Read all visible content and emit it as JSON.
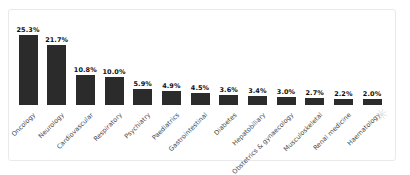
{
  "page": {
    "background": "#ffffff"
  },
  "panel": {
    "border_color": "#e9e9e9",
    "background": "#ffffff"
  },
  "chart_data": {
    "type": "bar",
    "title": "",
    "xlabel": "",
    "ylabel": "",
    "categories": [
      "Oncology",
      "Neurology",
      "Cardiovascular",
      "Respiratory",
      "Psychiatry",
      "Paediatrics",
      "Gastrointestinal",
      "Diabetes",
      "Hepatobiliary",
      "Obstetrics & gynaecology",
      "Musculoskeletal",
      "Renal medicine",
      "Haematology"
    ],
    "values": [
      25.3,
      21.7,
      10.8,
      10.0,
      5.9,
      4.9,
      4.5,
      3.6,
      3.4,
      3.0,
      2.7,
      2.2,
      2.0
    ],
    "value_labels": [
      "25.3%",
      "21.7%",
      "10.8%",
      "10.0%",
      "5.9%",
      "4.9%",
      "4.5%",
      "3.6%",
      "3.4%",
      "3.0%",
      "2.7%",
      "2.2%",
      "2.0%"
    ],
    "ylim": [
      0,
      27
    ],
    "grid": false,
    "legend": "none",
    "axes_visible": false,
    "bar_color": "#2b2b2b",
    "value_label_color": "#111111",
    "category_label_color": "#4a4a4a",
    "category_label_rotation_deg": -45
  },
  "decor": {
    "watermark_glyph": "✳",
    "watermark_color": "#e4e4e4"
  }
}
